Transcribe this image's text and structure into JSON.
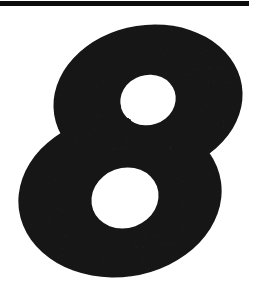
{
  "page": {
    "width": 265,
    "height": 287,
    "background_color": "#ffffff",
    "ink_color": "#1a1a1a"
  },
  "rule": {
    "name": "horizontal-rule",
    "color": "#0d0d0d",
    "x": 0,
    "y": 1,
    "width": 249,
    "height": 5
  },
  "numeral": {
    "value": "8",
    "label": "8",
    "color": "#1a1a1a",
    "style": "bold",
    "bbox": {
      "x": 18,
      "y": 25,
      "width": 225,
      "height": 252
    },
    "counters": [
      {
        "name": "upper-counter",
        "cx": 148,
        "cy": 100,
        "rx": 28,
        "ry": 25,
        "rotate": -18
      },
      {
        "name": "lower-counter",
        "cx": 125,
        "cy": 198,
        "rx": 34,
        "ry": 30,
        "rotate": -20
      }
    ]
  }
}
